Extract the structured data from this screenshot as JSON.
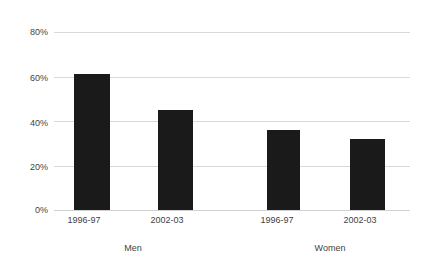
{
  "chart_data": {
    "type": "bar",
    "title": "",
    "subtitle": "",
    "xlabel": "",
    "ylabel": "",
    "ylim": [
      0,
      80
    ],
    "grid": true,
    "legend": false,
    "legend_position": "none",
    "categories": [
      "1996-97",
      "2002-03",
      "1996-97",
      "2002-03"
    ],
    "groups": [
      "Men",
      "Women"
    ],
    "values": [
      61,
      45,
      36,
      32
    ],
    "series": [
      {
        "name": "",
        "values": [
          61,
          45,
          36,
          32
        ]
      }
    ],
    "ytick_labels": [
      "80%",
      "60%",
      "40%",
      "20%",
      "0%"
    ],
    "ytick_values": [
      80,
      60,
      40,
      20,
      0
    ],
    "bar_color": "#1a1a1a",
    "gridline_color": "#d9d9d9",
    "text_color": "#3f3f3f",
    "background_color": "#ffffff"
  },
  "axis": {
    "yticks": [
      {
        "label": "80%",
        "value": 80
      },
      {
        "label": "60%",
        "value": 60
      },
      {
        "label": "40%",
        "value": 40
      },
      {
        "label": "20%",
        "value": 20
      },
      {
        "label": "0%",
        "value": 0
      }
    ],
    "xticks": [
      {
        "label": "1996-97"
      },
      {
        "label": "2002-03"
      },
      {
        "label": "1996-97"
      },
      {
        "label": "2002-03"
      }
    ],
    "groups": [
      {
        "label": "Men"
      },
      {
        "label": "Women"
      }
    ]
  },
  "bars": [
    {
      "label": "1996-97",
      "group": "Men",
      "value": 61
    },
    {
      "label": "2002-03",
      "group": "Men",
      "value": 45
    },
    {
      "label": "1996-97",
      "group": "Women",
      "value": 36
    },
    {
      "label": "2002-03",
      "group": "Women",
      "value": 32
    }
  ]
}
